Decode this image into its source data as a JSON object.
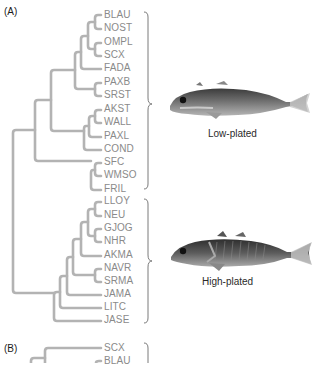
{
  "panel_a": {
    "label": "(A)",
    "taxa": [
      "BLAU",
      "NOST",
      "OMPL",
      "SCX",
      "FADA",
      "PAXB",
      "SRST",
      "AKST",
      "WALL",
      "PAXL",
      "COND",
      "SFC",
      "WMSO",
      "FRIL",
      "LLOY",
      "NEU",
      "GJOG",
      "NHR",
      "AKMA",
      "NAVR",
      "SRMA",
      "JAMA",
      "LITC",
      "JASE"
    ],
    "groups": [
      {
        "name": "low-plated",
        "caption": "Low-plated",
        "range": [
          "BLAU",
          "FRIL"
        ],
        "fish_icon": "low-plated-stickleback"
      },
      {
        "name": "high-plated",
        "caption": "High-plated",
        "range": [
          "LLOY",
          "JASE"
        ],
        "fish_icon": "high-plated-stickleback"
      }
    ]
  },
  "panel_b": {
    "label": "(B)",
    "taxa": [
      "SCX",
      "BLAU"
    ]
  },
  "colors": {
    "branch": "#b3b3b3",
    "taxon_text": "#8a8a8a",
    "label_text": "#1a1a1a",
    "fish_dark": "#3a3a3a",
    "fish_light": "#a8a8a8"
  }
}
